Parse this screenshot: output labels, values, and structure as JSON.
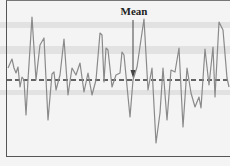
{
  "figure": {
    "annotation_label": "Mean",
    "colors": {
      "series_line": "#8a8a8a",
      "mean_line": "#333333",
      "background": "#f4f4f4",
      "scan_bands": "#dcdcdc",
      "frame": "#555555"
    }
  },
  "chart_data": {
    "type": "line",
    "title": "",
    "xlabel": "",
    "ylabel": "",
    "grid": false,
    "legend": null,
    "annotations": [
      {
        "text": "Mean",
        "type": "arrow",
        "points_to": "mean line",
        "x_index": 44
      }
    ],
    "mean_line": {
      "style": "dashed",
      "value": 0
    },
    "units_note": "No axis ticks shown; values are deviations from the mean in relative units (positive = above mean).",
    "x": [
      8,
      12,
      14,
      16,
      18,
      20,
      22,
      24,
      26,
      28,
      32,
      36,
      40,
      44,
      48,
      52,
      54,
      56,
      60,
      64,
      68,
      72,
      76,
      80,
      84,
      88,
      92,
      96,
      100,
      102,
      104,
      106,
      108,
      112,
      116,
      120,
      122,
      124,
      130,
      133,
      137,
      144,
      148,
      152,
      156,
      160,
      163,
      167,
      171,
      175,
      179,
      183,
      187,
      191,
      195,
      199,
      201,
      205,
      209,
      213,
      215,
      219,
      223,
      227,
      229
    ],
    "values": [
      12,
      21,
      12,
      7,
      13,
      -7,
      3,
      0,
      -35,
      0,
      63,
      0,
      35,
      42,
      -40,
      6,
      8,
      -10,
      5,
      41,
      -15,
      12,
      5,
      17,
      -12,
      7,
      -15,
      0,
      47,
      45,
      -2,
      32,
      30,
      -7,
      5,
      7,
      28,
      25,
      -37,
      0,
      13,
      61,
      -10,
      12,
      -63,
      -33,
      12,
      -40,
      10,
      8,
      32,
      -47,
      12,
      -13,
      -27,
      -17,
      -28,
      31,
      -5,
      33,
      -17,
      58,
      50,
      2,
      -7
    ],
    "ylim": [
      -80,
      80
    ]
  }
}
